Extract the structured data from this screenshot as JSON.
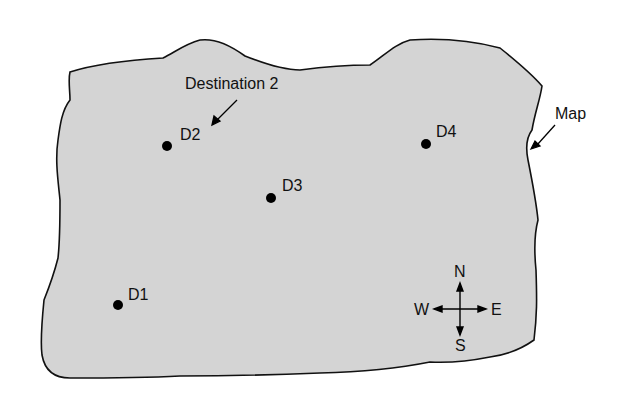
{
  "map": {
    "fill_color": "#d4d4d4",
    "outline_color": "#111111",
    "label": "Map",
    "callout": "Destination 2"
  },
  "destinations": [
    {
      "id": "D1",
      "x": 118,
      "y": 305
    },
    {
      "id": "D2",
      "x": 167,
      "y": 146
    },
    {
      "id": "D3",
      "x": 271,
      "y": 198
    },
    {
      "id": "D4",
      "x": 426,
      "y": 144
    }
  ],
  "compass": {
    "north": "N",
    "south": "S",
    "east": "E",
    "west": "W"
  }
}
